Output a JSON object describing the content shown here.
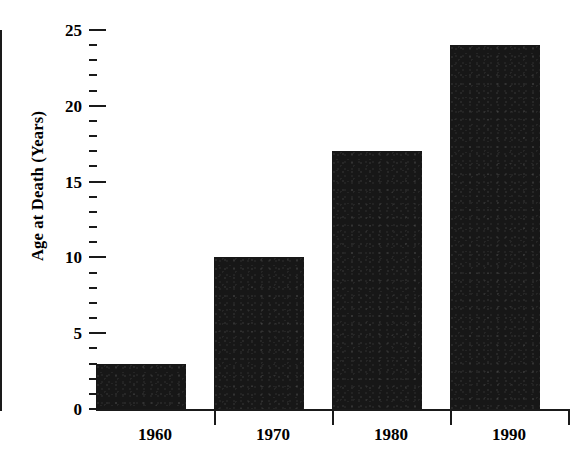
{
  "chart_data": {
    "type": "bar",
    "title": "",
    "xlabel": "",
    "ylabel": "Age at Death (Years)",
    "categories": [
      "1960",
      "1970",
      "1980",
      "1990"
    ],
    "values": [
      3,
      10,
      17,
      24
    ],
    "series": [
      {
        "name": "Age at Death",
        "values": [
          3,
          10,
          17,
          24
        ]
      }
    ],
    "ylim": [
      0,
      25
    ],
    "y_major_ticks": [
      0,
      5,
      10,
      15,
      20,
      25
    ],
    "y_major_tick_labels": [
      "0",
      "5",
      "10",
      "15",
      "20",
      "25"
    ],
    "y_minor_tick_interval": 1,
    "grid": false,
    "legend": null,
    "legend_position": "none",
    "bar_color": "#171717",
    "axis_color": "#1a1a1a",
    "background_color": "#ffffff"
  },
  "axes": {
    "y_title": "Age at Death (Years)",
    "y_tick_labels": [
      "0",
      "5",
      "10",
      "15",
      "20",
      "25"
    ],
    "x_tick_labels": [
      "1960",
      "1970",
      "1980",
      "1990"
    ]
  },
  "caption": {
    "text": ""
  }
}
